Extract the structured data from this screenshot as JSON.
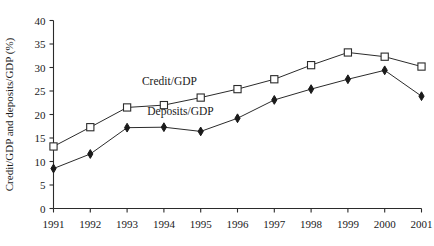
{
  "chart_data": {
    "type": "line",
    "title": "",
    "xlabel": "",
    "ylabel": "Credit/GDP and deposits/GDP (%)",
    "categories": [
      "1991",
      "1992",
      "1993",
      "1994",
      "1995",
      "1996",
      "1997",
      "1998",
      "1999",
      "2000",
      "2001"
    ],
    "x": [
      1991,
      1992,
      1993,
      1994,
      1995,
      1996,
      1997,
      1998,
      1999,
      2000,
      2001
    ],
    "ylim": [
      0,
      40
    ],
    "yticks": [
      0,
      5,
      10,
      15,
      20,
      25,
      30,
      35,
      40
    ],
    "ytick_labels": [
      "0",
      "5",
      "10",
      "15",
      "20",
      "25",
      "30",
      "35",
      "40"
    ],
    "grid": false,
    "legend_position": "inline-annotations",
    "series": [
      {
        "name": "Credit/GDP",
        "marker": "open-square",
        "values": [
          13.2,
          17.3,
          21.5,
          22.0,
          23.6,
          25.4,
          27.5,
          30.5,
          33.2,
          32.3,
          30.2
        ]
      },
      {
        "name": "Deposits/GDP",
        "marker": "filled-diamond",
        "values": [
          8.5,
          11.6,
          17.2,
          17.3,
          16.4,
          19.2,
          23.1,
          25.4,
          27.5,
          29.4,
          23.9
        ]
      }
    ],
    "annotations": [
      {
        "text": "Credit/GDP",
        "x_frac": 0.315,
        "y_value": 26.3
      },
      {
        "text": "Deposits/GDP",
        "x_frac": 0.345,
        "y_value": 20.0
      }
    ]
  }
}
